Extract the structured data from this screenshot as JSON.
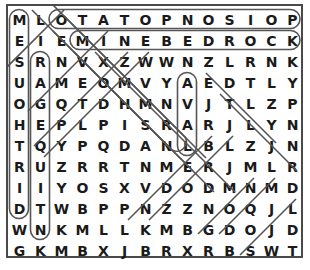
{
  "puzzle": {
    "type": "word-search",
    "rows": 12,
    "cols": 14,
    "border_color": "#4a4a4a",
    "letter_color": "#1a1a1a",
    "highlight_color": "#555555",
    "background_color": "#ffffff",
    "grid": [
      [
        "M",
        "L",
        "O",
        "T",
        "A",
        "T",
        "O",
        "P",
        "N",
        "O",
        "S",
        "I",
        "O",
        "P"
      ],
      [
        "E",
        "I",
        "E",
        "M",
        "I",
        "N",
        "E",
        "B",
        "E",
        "D",
        "R",
        "O",
        "C",
        "K"
      ],
      [
        "S",
        "R",
        "N",
        "V",
        "X",
        "Z",
        "W",
        "W",
        "N",
        "Z",
        "L",
        "R",
        "N",
        "K"
      ],
      [
        "U",
        "A",
        "M",
        "E",
        "O",
        "M",
        "V",
        "Y",
        "A",
        "E",
        "D",
        "T",
        "L",
        "Y"
      ],
      [
        "O",
        "G",
        "Q",
        "T",
        "D",
        "H",
        "M",
        "N",
        "V",
        "J",
        "T",
        "L",
        "Z",
        "P"
      ],
      [
        "H",
        "E",
        "P",
        "L",
        "P",
        "I",
        "S",
        "R",
        "A",
        "R",
        "J",
        "L",
        "Y",
        "N"
      ],
      [
        "T",
        "Q",
        "Y",
        "P",
        "Q",
        "D",
        "A",
        "N",
        "L",
        "B",
        "L",
        "Z",
        "J",
        "N"
      ],
      [
        "R",
        "U",
        "Z",
        "R",
        "R",
        "T",
        "N",
        "M",
        "E",
        "R",
        "J",
        "M",
        "L",
        "R"
      ],
      [
        "I",
        "I",
        "Y",
        "O",
        "S",
        "X",
        "V",
        "D",
        "O",
        "D",
        "M",
        "N",
        "M",
        "D"
      ],
      [
        "D",
        "T",
        "W",
        "B",
        "P",
        "P",
        "N",
        "Z",
        "Z",
        "N",
        "O",
        "Q",
        "J",
        "L"
      ],
      [
        "W",
        "N",
        "K",
        "M",
        "L",
        "L",
        "K",
        "M",
        "B",
        "G",
        "D",
        "O",
        "J",
        "D"
      ],
      [
        "G",
        "K",
        "M",
        "B",
        "X",
        "J",
        "B",
        "R",
        "X",
        "R",
        "B",
        "S",
        "W",
        "T"
      ]
    ],
    "found_words": [
      {
        "text": "OTATOPNOSIOP",
        "reads": "POISONPOTATO",
        "orientation": "horizontal",
        "start": {
          "row": 0,
          "col": 2
        },
        "end": {
          "row": 0,
          "col": 13
        }
      },
      {
        "text": "MINEBEDROCK",
        "reads": "MINEBEDROCK",
        "orientation": "horizontal",
        "start": {
          "row": 1,
          "col": 3
        },
        "end": {
          "row": 1,
          "col": 13
        }
      },
      {
        "text": "MESUOHTRID",
        "reads": "DIRTHOUSEM",
        "orientation": "vertical",
        "start": {
          "row": 0,
          "col": 0
        },
        "end": {
          "row": 9,
          "col": 0
        }
      },
      {
        "text": "RAGEQUITN",
        "reads": "RAGEQUITN",
        "orientation": "vertical",
        "start": {
          "row": 2,
          "col": 1
        },
        "end": {
          "row": 10,
          "col": 1
        }
      },
      {
        "text": "AVAL",
        "reads": "LAVA",
        "orientation": "vertical",
        "start": {
          "row": 3,
          "col": 8
        },
        "end": {
          "row": 6,
          "col": 8
        }
      },
      {
        "text": "LIEMNAS",
        "orientation": "diagonal-down-left",
        "start": {
          "row": 0,
          "col": 1
        },
        "end": {
          "row": 6,
          "col": 7
        }
      },
      {
        "text": "ENMDRTWN",
        "orientation": "diagonal-down-left",
        "start": {
          "row": 1,
          "col": 2
        },
        "end": {
          "row": 10,
          "col": 1
        }
      },
      {
        "text": "OEMSTS",
        "orientation": "diagonal-down-left",
        "start": {
          "row": 0,
          "col": 2
        },
        "end": {
          "row": 8,
          "col": 4
        }
      },
      {
        "text": "EVSRND",
        "orientation": "diagonal-down-right",
        "start": {
          "row": 2,
          "col": 3
        },
        "end": {
          "row": 9,
          "col": 2
        }
      },
      {
        "text": "ENRNDODW",
        "orientation": "diagonal-down-right",
        "start": {
          "row": 3,
          "col": 9
        },
        "end": {
          "row": 11,
          "col": 12
        }
      },
      {
        "text": "ANODOS",
        "orientation": "diagonal-down-right",
        "start": {
          "row": 6,
          "col": 7
        },
        "end": {
          "row": 11,
          "col": 11
        }
      },
      {
        "text": "RDNOG",
        "orientation": "diagonal-down-right",
        "start": {
          "row": 5,
          "col": 9
        },
        "end": {
          "row": 10,
          "col": 9
        }
      }
    ]
  }
}
